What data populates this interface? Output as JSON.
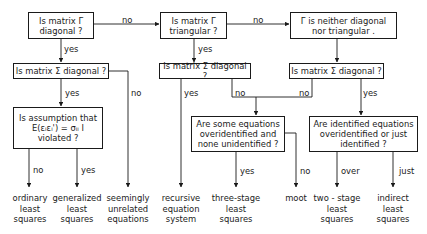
{
  "diagram": {
    "nodes": {
      "gamma_diagonal": {
        "lines": [
          "Is matrix Γ",
          "diagonal ?"
        ]
      },
      "gamma_triangular": {
        "lines": [
          "Is matrix Γ",
          "triangular ?"
        ]
      },
      "gamma_neither": {
        "lines": [
          "Γ is neither diagonal",
          "nor triangular ."
        ]
      },
      "sigma_diag_left": {
        "lines": [
          "Is matrix Σ diagonal ?"
        ]
      },
      "sigma_diag_mid": {
        "lines": [
          "Is matrix Σ diagonal ?"
        ]
      },
      "sigma_diag_right": {
        "lines": [
          "Is matrix Σ diagonal ?"
        ]
      },
      "assumption": {
        "lines": [
          "Is assumption that",
          "E(εᵢεᵢ') = σᵢᵢ I",
          "violated ?"
        ]
      },
      "some_overidentified": {
        "lines": [
          "Are some equations",
          "overidentified and",
          "none unidentified ?"
        ]
      },
      "identified_over_just": {
        "lines": [
          "Are identified equations",
          "overidentified or just",
          "identified ?"
        ]
      }
    },
    "edge_labels": {
      "g_diag_no": "no",
      "g_tri_no": "no",
      "g_diag_yes": "yes",
      "g_tri_yes": "yes",
      "s_left_yes": "yes",
      "s_left_no": "no",
      "s_mid_yes": "yes",
      "s_mid_no": "no",
      "s_right_no": "no",
      "s_right_yes": "yes",
      "assump_no": "no",
      "assump_yes": "yes",
      "some_yes": "yes",
      "some_no": "no",
      "ident_over": "over",
      "ident_just": "just"
    },
    "outcomes": {
      "ols": [
        "ordinary",
        "least",
        "squares"
      ],
      "gls": [
        "generalized",
        "least",
        "squares"
      ],
      "sur": [
        "seemingly",
        "unrelated",
        "equations"
      ],
      "recursive": [
        "recursive",
        "equation",
        "system"
      ],
      "three_stage": [
        "three-stage",
        "least",
        "squares"
      ],
      "moot": [
        "moot"
      ],
      "two_stage": [
        "two - stage",
        "least",
        "squares"
      ],
      "indirect": [
        "indirect",
        "least",
        "squares"
      ]
    }
  }
}
